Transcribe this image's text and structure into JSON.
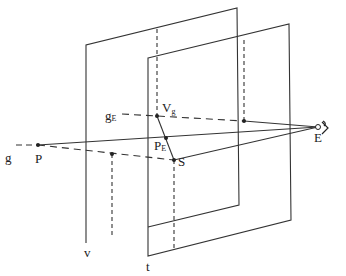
{
  "diagram": {
    "title": "",
    "labels": {
      "g": "g",
      "P": "P",
      "gE_main": "g",
      "gE_sub": "E",
      "Vg_main": "V",
      "Vg_sub": "g",
      "PE_main": "P",
      "PE_sub": "E",
      "S": "S",
      "E": "E",
      "v": "v",
      "t": "t"
    },
    "planes": [
      {
        "name": "v",
        "points": [
          [
            86,
            45
          ],
          [
            237,
            8
          ],
          [
            239,
            205
          ],
          [
            87,
            243
          ]
        ]
      },
      {
        "name": "t",
        "points": [
          [
            148,
            58
          ],
          [
            289,
            24
          ],
          [
            291,
            220
          ],
          [
            148,
            256
          ]
        ]
      }
    ],
    "points": {
      "P": [
        38,
        145
      ],
      "Vg": [
        157,
        116
      ],
      "PE": [
        166,
        138
      ],
      "S": [
        174,
        160
      ],
      "gE_foot": [
        244,
        121
      ],
      "P_foot": [
        112,
        154
      ],
      "E": [
        318,
        127
      ]
    },
    "colors": {
      "ink": "#333333",
      "background": "#ffffff"
    }
  }
}
